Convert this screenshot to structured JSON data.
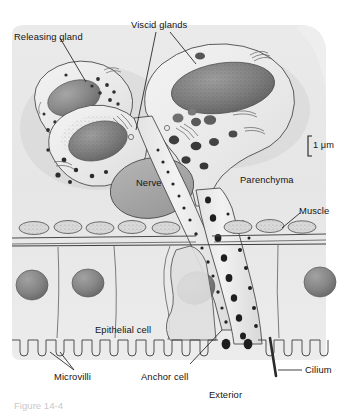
{
  "figure": {
    "caption": "Figure 14-4",
    "scale_bar": "1 μm",
    "background_color": "#e8e8e8",
    "ink_color": "#3a3a3a",
    "nucleus_color": "#8e8e8e",
    "granule_color": "#4a4a4a",
    "cytoplasm_color": "#ededed"
  },
  "labels": {
    "releasing_gland": "Releasing gland",
    "viscid_glands": "Viscid glands",
    "nerve": "Nerve",
    "parenchyma": "Parenchyma",
    "muscle": "Muscle",
    "epithelial_cell": "Epithelial cell",
    "microvilli": "Microvilli",
    "anchor_cell": "Anchor cell",
    "cilium": "Cilium",
    "exterior": "Exterior"
  },
  "structures": [
    {
      "name": "releasing-gland-cell",
      "kind": "gland",
      "nucleus": "dark-oval",
      "granules": "small-dark-dots"
    },
    {
      "name": "viscid-gland-cell-left",
      "kind": "gland",
      "nucleus": "stippled-oval",
      "granules": "small-dark-dots"
    },
    {
      "name": "viscid-gland-cell-right",
      "kind": "gland",
      "nucleus": "large-stippled-oval",
      "granules": "medium-dark-ovals"
    },
    {
      "name": "nerve-body",
      "kind": "nerve",
      "fill": "uniform-gray"
    },
    {
      "name": "muscle-layer",
      "kind": "muscle",
      "shape": "lens-shaped-cells-on-band"
    },
    {
      "name": "epithelial-layer",
      "kind": "epithelium",
      "nuclei": "round-gray"
    },
    {
      "name": "anchor-cell",
      "kind": "anchor"
    },
    {
      "name": "duct-left",
      "kind": "duct",
      "contents": "granules"
    },
    {
      "name": "duct-right",
      "kind": "duct",
      "contents": "granules"
    },
    {
      "name": "microvilli-border",
      "kind": "brush-border"
    },
    {
      "name": "cilium-rod",
      "kind": "cilium"
    }
  ]
}
